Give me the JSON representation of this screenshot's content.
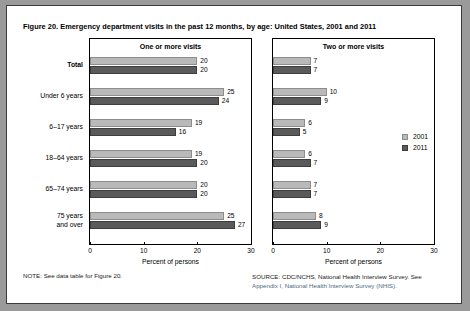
{
  "figure": {
    "title": "Figure 20. Emergency department visits in the past 12 months, by age: United States, 2001 and 2011",
    "note": "NOTE: See data table for Figure 20.",
    "source_line1": "SOURCE: CDC/NCHS, National Health Interview Survey. See",
    "source_line2": "Appendix I, National Health Interview Survey (NHIS)."
  },
  "legend": {
    "items": [
      {
        "label": "2001",
        "color": "#b9b9b9"
      },
      {
        "label": "2011",
        "color": "#5a5a5a"
      }
    ]
  },
  "chart_data": {
    "type": "bar",
    "title": "Figure 20. Emergency department visits in the past 12 months, by age: United States, 2001 and 2011",
    "orientation": "horizontal",
    "categories": [
      "Total",
      "Under 6 years",
      "6–17 years",
      "18–64 years",
      "65–74 years",
      "75 years\nand over"
    ],
    "xlabel": "Percent of persons",
    "ylabel": "",
    "xlim": [
      0,
      30
    ],
    "xticks": [
      0,
      10,
      20,
      30
    ],
    "grid": false,
    "legend_position": "right-panel-center",
    "panels": [
      {
        "title": "One or more visits",
        "xlabel": "Percent of persons",
        "xlim": [
          0,
          30
        ],
        "xticks": [
          0,
          10,
          20,
          30
        ],
        "series": [
          {
            "name": "2001",
            "color": "#b9b9b9",
            "values": [
              20,
              25,
              19,
              19,
              20,
              25
            ]
          },
          {
            "name": "2011",
            "color": "#5a5a5a",
            "values": [
              20,
              24,
              16,
              20,
              20,
              27
            ]
          }
        ]
      },
      {
        "title": "Two or more visits",
        "xlabel": "Percent of persons",
        "xlim": [
          0,
          30
        ],
        "xticks": [
          0,
          10,
          20,
          30
        ],
        "series": [
          {
            "name": "2001",
            "color": "#b9b9b9",
            "values": [
              7,
              10,
              6,
              6,
              7,
              8
            ]
          },
          {
            "name": "2011",
            "color": "#5a5a5a",
            "values": [
              7,
              9,
              5,
              7,
              7,
              9
            ]
          }
        ]
      }
    ]
  }
}
